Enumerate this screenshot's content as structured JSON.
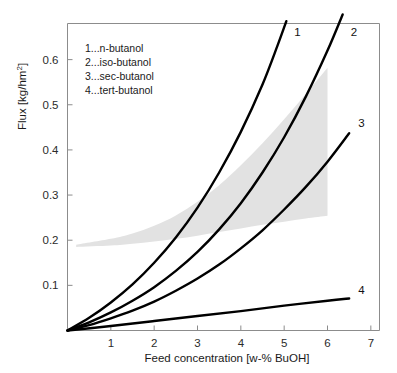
{
  "chart_data": {
    "type": "line",
    "title": "",
    "xlabel": "Feed concentration [w-% BuOH]",
    "ylabel": "Flux [kg/hm2]",
    "ylabel_base": "Flux [kg/hm",
    "ylabel_sup": "2",
    "ylabel_tail": "]",
    "xlim": [
      0,
      7.2
    ],
    "ylim": [
      0,
      0.68
    ],
    "xticks": [
      1,
      2,
      3,
      4,
      5,
      6,
      7
    ],
    "xticklabels": [
      "1",
      "2",
      "3",
      "4",
      "5",
      "6",
      "7"
    ],
    "yticks": [
      0.1,
      0.2,
      0.3,
      0.4,
      0.5,
      0.6
    ],
    "yticklabels": [
      "0.1",
      "0.2",
      "0.3",
      "0.4",
      "0.5",
      "0.6"
    ],
    "grid": false,
    "legend_position": "upper-left-inside",
    "legend_entries": [
      "1...n-butanol",
      "2...iso-butanol",
      "3...sec-butanol",
      "4...tert-butanol"
    ],
    "curve_end_labels": [
      "1",
      "2",
      "3",
      "4"
    ],
    "colors": {
      "curve": "#000000",
      "band": "#e2e2e2",
      "axis": "#8c8c8c",
      "text": "#1a1a1a",
      "background": "#ffffff"
    },
    "series": [
      {
        "name": "n-butanol",
        "label": "1",
        "points": [
          [
            0.0,
            0.0
          ],
          [
            0.5,
            0.028
          ],
          [
            1.0,
            0.062
          ],
          [
            1.5,
            0.102
          ],
          [
            2.0,
            0.15
          ],
          [
            2.5,
            0.206
          ],
          [
            3.0,
            0.272
          ],
          [
            3.5,
            0.35
          ],
          [
            4.0,
            0.44
          ],
          [
            4.5,
            0.545
          ],
          [
            4.85,
            0.632
          ],
          [
            5.05,
            0.685
          ]
        ]
      },
      {
        "name": "iso-butanol",
        "label": "2",
        "points": [
          [
            0.0,
            0.0
          ],
          [
            0.5,
            0.018
          ],
          [
            1.0,
            0.04
          ],
          [
            1.5,
            0.066
          ],
          [
            2.0,
            0.096
          ],
          [
            2.5,
            0.132
          ],
          [
            3.0,
            0.174
          ],
          [
            3.5,
            0.224
          ],
          [
            4.0,
            0.282
          ],
          [
            4.5,
            0.35
          ],
          [
            5.0,
            0.428
          ],
          [
            5.5,
            0.518
          ],
          [
            6.0,
            0.62
          ],
          [
            6.35,
            0.7
          ]
        ]
      },
      {
        "name": "sec-butanol",
        "label": "3",
        "points": [
          [
            0.0,
            0.0
          ],
          [
            0.5,
            0.012
          ],
          [
            1.0,
            0.027
          ],
          [
            1.5,
            0.044
          ],
          [
            2.0,
            0.064
          ],
          [
            2.5,
            0.088
          ],
          [
            3.0,
            0.115
          ],
          [
            3.5,
            0.146
          ],
          [
            4.0,
            0.182
          ],
          [
            4.5,
            0.222
          ],
          [
            5.0,
            0.268
          ],
          [
            5.5,
            0.318
          ],
          [
            6.0,
            0.374
          ],
          [
            6.5,
            0.437
          ]
        ]
      },
      {
        "name": "tert-butanol",
        "label": "4",
        "points": [
          [
            0.0,
            0.0
          ],
          [
            1.0,
            0.01
          ],
          [
            2.0,
            0.021
          ],
          [
            3.0,
            0.032
          ],
          [
            4.0,
            0.043
          ],
          [
            5.0,
            0.055
          ],
          [
            6.0,
            0.066
          ],
          [
            6.5,
            0.071
          ]
        ]
      }
    ],
    "shaded_band": {
      "name": "literature-data-range",
      "fill": "#e2e2e2",
      "x_start": 0.2,
      "x_end": 6.0,
      "upper": [
        [
          0.2,
          0.19
        ],
        [
          1.0,
          0.203
        ],
        [
          1.5,
          0.215
        ],
        [
          2.0,
          0.232
        ],
        [
          2.5,
          0.255
        ],
        [
          3.0,
          0.285
        ],
        [
          3.5,
          0.322
        ],
        [
          4.0,
          0.366
        ],
        [
          4.5,
          0.415
        ],
        [
          5.0,
          0.468
        ],
        [
          5.5,
          0.524
        ],
        [
          6.0,
          0.582
        ]
      ],
      "lower": [
        [
          0.2,
          0.185
        ],
        [
          1.0,
          0.188
        ],
        [
          1.5,
          0.192
        ],
        [
          2.0,
          0.197
        ],
        [
          2.5,
          0.203
        ],
        [
          3.0,
          0.21
        ],
        [
          3.5,
          0.218
        ],
        [
          4.0,
          0.226
        ],
        [
          4.5,
          0.234
        ],
        [
          5.0,
          0.241
        ],
        [
          5.5,
          0.248
        ],
        [
          6.0,
          0.254
        ]
      ]
    }
  }
}
